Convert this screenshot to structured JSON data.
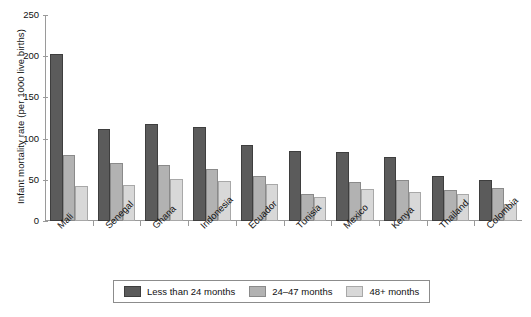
{
  "chart_data": {
    "type": "bar",
    "title": "",
    "xlabel": "",
    "ylabel": "Infant mortality rate (per 1000 live births)",
    "ylim": [
      0,
      250
    ],
    "yticks": [
      0,
      50,
      100,
      150,
      200,
      250
    ],
    "grid": false,
    "legend_position": "bottom",
    "categories": [
      "Mali",
      "Senegal",
      "Ghana",
      "Indonesia",
      "Ecuador",
      "Tunisia",
      "Mexico",
      "Kenya",
      "Thailand",
      "Colombia"
    ],
    "series": [
      {
        "name": "Less than 24 months",
        "color": "#5b5b5b",
        "values": [
          203,
          112,
          118,
          114,
          92,
          85,
          84,
          78,
          55,
          50
        ]
      },
      {
        "name": "24–47 months",
        "color": "#b2b2b2",
        "values": [
          80,
          71,
          68,
          63,
          55,
          33,
          47,
          50,
          38,
          40
        ]
      },
      {
        "name": "48+ months",
        "color": "#d8d8d8",
        "values": [
          42,
          44,
          51,
          49,
          45,
          29,
          39,
          35,
          33,
          21
        ]
      }
    ]
  }
}
